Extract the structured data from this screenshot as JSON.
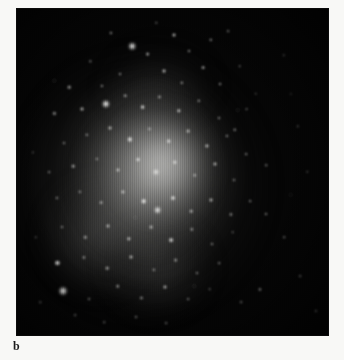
{
  "figure": {
    "panel_label": "b",
    "caption": "",
    "colors": {
      "page_background": "#f8f8f6",
      "plate_background": "#050505",
      "star_color": "#ffffff",
      "nebula_glow": "#9a9a98",
      "label_color": "#1a1a1a"
    },
    "plate": {
      "x": 17,
      "y": 9,
      "width": 311,
      "height": 326
    },
    "image_type": "astronomical-photographic-plate",
    "nebulosity": [
      {
        "name": "outer-halo",
        "cx": 42,
        "cy": 54,
        "rx": 48,
        "ry": 46,
        "opacity": 0.5
      },
      {
        "name": "mid-halo",
        "cx": 43,
        "cy": 52,
        "rx": 31,
        "ry": 34,
        "opacity": 0.62
      },
      {
        "name": "bright-core",
        "cx": 47,
        "cy": 48,
        "rx": 17,
        "ry": 18,
        "opacity": 0.7
      },
      {
        "name": "south-west-spur",
        "cx": 24,
        "cy": 74,
        "rx": 22,
        "ry": 22,
        "opacity": 0.34
      },
      {
        "name": "south-spur",
        "cx": 46,
        "cy": 84,
        "rx": 20,
        "ry": 18,
        "opacity": 0.3
      },
      {
        "name": "north-spur",
        "cx": 45,
        "cy": 18,
        "rx": 21,
        "ry": 16,
        "opacity": 0.22
      }
    ],
    "stars": [
      {
        "x": 30.2,
        "y": 7.4,
        "r": 1.6,
        "b": 0.7
      },
      {
        "x": 44.8,
        "y": 4.2,
        "r": 1.2,
        "b": 0.55
      },
      {
        "x": 37.0,
        "y": 11.5,
        "r": 3.3,
        "b": 0.95
      },
      {
        "x": 42.0,
        "y": 13.8,
        "r": 1.9,
        "b": 0.72
      },
      {
        "x": 50.6,
        "y": 8.0,
        "r": 2.0,
        "b": 0.74
      },
      {
        "x": 55.4,
        "y": 13.0,
        "r": 1.5,
        "b": 0.6
      },
      {
        "x": 62.4,
        "y": 9.5,
        "r": 1.7,
        "b": 0.66
      },
      {
        "x": 67.8,
        "y": 6.8,
        "r": 1.4,
        "b": 0.56
      },
      {
        "x": 23.6,
        "y": 16.0,
        "r": 1.2,
        "b": 0.48
      },
      {
        "x": 16.8,
        "y": 24.0,
        "r": 1.8,
        "b": 0.62
      },
      {
        "x": 27.4,
        "y": 23.5,
        "r": 1.6,
        "b": 0.58
      },
      {
        "x": 33.0,
        "y": 20.0,
        "r": 1.5,
        "b": 0.6
      },
      {
        "x": 47.2,
        "y": 19.0,
        "r": 2.0,
        "b": 0.72
      },
      {
        "x": 53.0,
        "y": 22.6,
        "r": 1.7,
        "b": 0.64
      },
      {
        "x": 59.8,
        "y": 18.0,
        "r": 1.9,
        "b": 0.68
      },
      {
        "x": 65.2,
        "y": 23.0,
        "r": 1.5,
        "b": 0.58
      },
      {
        "x": 71.6,
        "y": 17.6,
        "r": 1.3,
        "b": 0.5
      },
      {
        "x": 76.8,
        "y": 26.0,
        "r": 1.2,
        "b": 0.44
      },
      {
        "x": 73.8,
        "y": 30.6,
        "r": 1.4,
        "b": 0.5
      },
      {
        "x": 85.8,
        "y": 14.2,
        "r": 1.2,
        "b": 0.42
      },
      {
        "x": 90.2,
        "y": 36.0,
        "r": 1.2,
        "b": 0.4
      },
      {
        "x": 12.0,
        "y": 32.0,
        "r": 1.6,
        "b": 0.56
      },
      {
        "x": 21.0,
        "y": 30.8,
        "r": 2.0,
        "b": 0.68
      },
      {
        "x": 28.6,
        "y": 29.0,
        "r": 3.6,
        "b": 1.0
      },
      {
        "x": 34.8,
        "y": 26.6,
        "r": 1.8,
        "b": 0.64
      },
      {
        "x": 40.4,
        "y": 30.0,
        "r": 2.4,
        "b": 0.8
      },
      {
        "x": 45.8,
        "y": 27.0,
        "r": 1.6,
        "b": 0.62
      },
      {
        "x": 52.0,
        "y": 31.2,
        "r": 2.2,
        "b": 0.76
      },
      {
        "x": 58.4,
        "y": 28.2,
        "r": 1.7,
        "b": 0.64
      },
      {
        "x": 64.8,
        "y": 33.4,
        "r": 1.5,
        "b": 0.56
      },
      {
        "x": 70.0,
        "y": 37.0,
        "r": 1.8,
        "b": 0.62
      },
      {
        "x": 15.0,
        "y": 41.0,
        "r": 1.5,
        "b": 0.54
      },
      {
        "x": 22.4,
        "y": 38.6,
        "r": 1.7,
        "b": 0.6
      },
      {
        "x": 30.0,
        "y": 36.4,
        "r": 2.0,
        "b": 0.7
      },
      {
        "x": 36.2,
        "y": 40.0,
        "r": 2.6,
        "b": 0.84
      },
      {
        "x": 42.6,
        "y": 36.8,
        "r": 1.6,
        "b": 0.6
      },
      {
        "x": 48.8,
        "y": 40.6,
        "r": 2.3,
        "b": 0.78
      },
      {
        "x": 55.0,
        "y": 37.4,
        "r": 1.9,
        "b": 0.68
      },
      {
        "x": 61.0,
        "y": 42.0,
        "r": 2.1,
        "b": 0.72
      },
      {
        "x": 67.4,
        "y": 39.0,
        "r": 1.6,
        "b": 0.58
      },
      {
        "x": 73.6,
        "y": 44.6,
        "r": 1.4,
        "b": 0.52
      },
      {
        "x": 80.2,
        "y": 48.0,
        "r": 1.3,
        "b": 0.46
      },
      {
        "x": 10.4,
        "y": 50.0,
        "r": 1.4,
        "b": 0.5
      },
      {
        "x": 18.0,
        "y": 48.2,
        "r": 1.8,
        "b": 0.62
      },
      {
        "x": 25.6,
        "y": 46.0,
        "r": 1.6,
        "b": 0.58
      },
      {
        "x": 32.4,
        "y": 49.4,
        "r": 2.0,
        "b": 0.7
      },
      {
        "x": 39.0,
        "y": 46.2,
        "r": 2.4,
        "b": 0.8
      },
      {
        "x": 44.6,
        "y": 50.0,
        "r": 3.0,
        "b": 0.92
      },
      {
        "x": 50.8,
        "y": 47.0,
        "r": 2.2,
        "b": 0.74
      },
      {
        "x": 57.2,
        "y": 51.0,
        "r": 1.8,
        "b": 0.64
      },
      {
        "x": 63.6,
        "y": 47.6,
        "r": 2.0,
        "b": 0.68
      },
      {
        "x": 69.8,
        "y": 52.4,
        "r": 1.5,
        "b": 0.54
      },
      {
        "x": 12.8,
        "y": 58.0,
        "r": 1.6,
        "b": 0.56
      },
      {
        "x": 20.2,
        "y": 56.0,
        "r": 1.7,
        "b": 0.6
      },
      {
        "x": 27.0,
        "y": 59.4,
        "r": 1.9,
        "b": 0.66
      },
      {
        "x": 34.0,
        "y": 56.2,
        "r": 2.1,
        "b": 0.72
      },
      {
        "x": 40.8,
        "y": 59.0,
        "r": 2.8,
        "b": 0.88
      },
      {
        "x": 45.2,
        "y": 61.6,
        "r": 3.4,
        "b": 0.98
      },
      {
        "x": 50.0,
        "y": 58.0,
        "r": 2.5,
        "b": 0.82
      },
      {
        "x": 56.0,
        "y": 62.0,
        "r": 1.8,
        "b": 0.64
      },
      {
        "x": 62.4,
        "y": 58.6,
        "r": 2.0,
        "b": 0.68
      },
      {
        "x": 68.8,
        "y": 63.0,
        "r": 1.6,
        "b": 0.56
      },
      {
        "x": 75.0,
        "y": 59.0,
        "r": 1.4,
        "b": 0.5
      },
      {
        "x": 14.6,
        "y": 67.0,
        "r": 1.5,
        "b": 0.54
      },
      {
        "x": 22.0,
        "y": 70.0,
        "r": 1.7,
        "b": 0.58
      },
      {
        "x": 29.4,
        "y": 66.6,
        "r": 2.0,
        "b": 0.68
      },
      {
        "x": 36.0,
        "y": 70.4,
        "r": 2.2,
        "b": 0.74
      },
      {
        "x": 43.0,
        "y": 67.0,
        "r": 1.9,
        "b": 0.66
      },
      {
        "x": 49.6,
        "y": 71.0,
        "r": 2.4,
        "b": 0.78
      },
      {
        "x": 56.2,
        "y": 67.6,
        "r": 1.7,
        "b": 0.6
      },
      {
        "x": 62.8,
        "y": 72.0,
        "r": 1.5,
        "b": 0.54
      },
      {
        "x": 69.4,
        "y": 68.4,
        "r": 1.3,
        "b": 0.46
      },
      {
        "x": 13.0,
        "y": 78.0,
        "r": 2.6,
        "b": 0.86
      },
      {
        "x": 21.6,
        "y": 76.2,
        "r": 1.6,
        "b": 0.56
      },
      {
        "x": 29.0,
        "y": 79.6,
        "r": 1.8,
        "b": 0.62
      },
      {
        "x": 36.8,
        "y": 76.0,
        "r": 2.0,
        "b": 0.68
      },
      {
        "x": 44.0,
        "y": 80.0,
        "r": 1.7,
        "b": 0.6
      },
      {
        "x": 51.0,
        "y": 77.0,
        "r": 1.9,
        "b": 0.64
      },
      {
        "x": 58.0,
        "y": 81.0,
        "r": 1.5,
        "b": 0.52
      },
      {
        "x": 65.0,
        "y": 78.0,
        "r": 1.4,
        "b": 0.48
      },
      {
        "x": 14.8,
        "y": 86.4,
        "r": 4.0,
        "b": 1.0
      },
      {
        "x": 23.0,
        "y": 89.0,
        "r": 1.5,
        "b": 0.52
      },
      {
        "x": 32.4,
        "y": 85.0,
        "r": 1.8,
        "b": 0.62
      },
      {
        "x": 40.0,
        "y": 88.6,
        "r": 1.6,
        "b": 0.56
      },
      {
        "x": 47.6,
        "y": 85.4,
        "r": 2.0,
        "b": 0.66
      },
      {
        "x": 55.0,
        "y": 89.0,
        "r": 1.4,
        "b": 0.48
      },
      {
        "x": 62.0,
        "y": 86.0,
        "r": 1.3,
        "b": 0.44
      },
      {
        "x": 18.6,
        "y": 94.0,
        "r": 1.4,
        "b": 0.48
      },
      {
        "x": 28.0,
        "y": 96.0,
        "r": 1.3,
        "b": 0.44
      },
      {
        "x": 38.4,
        "y": 94.4,
        "r": 1.5,
        "b": 0.5
      },
      {
        "x": 48.0,
        "y": 96.4,
        "r": 1.4,
        "b": 0.46
      },
      {
        "x": 80.0,
        "y": 63.0,
        "r": 1.5,
        "b": 0.52
      },
      {
        "x": 86.0,
        "y": 70.0,
        "r": 1.3,
        "b": 0.44
      },
      {
        "x": 91.0,
        "y": 82.0,
        "r": 1.4,
        "b": 0.48
      },
      {
        "x": 96.0,
        "y": 92.6,
        "r": 1.6,
        "b": 0.56
      },
      {
        "x": 93.4,
        "y": 50.0,
        "r": 1.2,
        "b": 0.38
      },
      {
        "x": 88.0,
        "y": 26.0,
        "r": 1.1,
        "b": 0.34
      },
      {
        "x": 78.0,
        "y": 86.0,
        "r": 1.6,
        "b": 0.56
      },
      {
        "x": 72.0,
        "y": 90.0,
        "r": 1.4,
        "b": 0.48
      },
      {
        "x": 6.0,
        "y": 70.0,
        "r": 1.2,
        "b": 0.38
      },
      {
        "x": 7.4,
        "y": 90.0,
        "r": 1.3,
        "b": 0.42
      },
      {
        "x": 5.0,
        "y": 44.0,
        "r": 1.1,
        "b": 0.34
      }
    ]
  }
}
